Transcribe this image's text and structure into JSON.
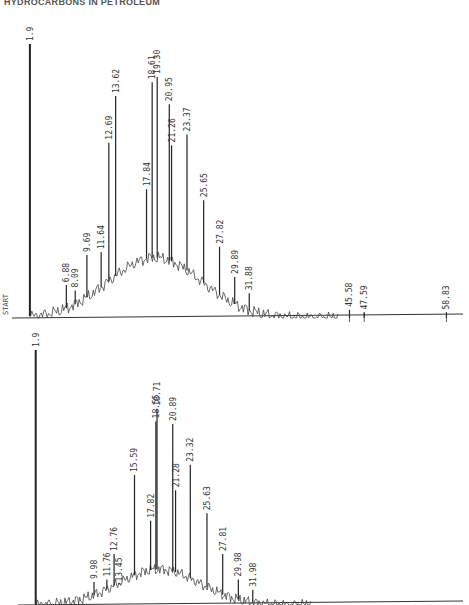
{
  "page": {
    "header": "HYDROCARBONS IN PETROLEUM"
  },
  "chart_data": [
    {
      "type": "line",
      "title": "Chromatogram A (top)",
      "xlabel": "Retention time (min)",
      "ylabel": "Detector response (relative)",
      "start_marker": "START",
      "solvent_peak_label": "1.9",
      "grid": false,
      "ylim": [
        0,
        100
      ],
      "peaks": [
        {
          "rt": 1.9,
          "height": 100
        },
        {
          "rt": 6.88,
          "height": 12
        },
        {
          "rt": 8.09,
          "height": 10
        },
        {
          "rt": 9.69,
          "height": 23
        },
        {
          "rt": 11.64,
          "height": 24
        },
        {
          "rt": 12.69,
          "height": 64
        },
        {
          "rt": 13.62,
          "height": 81
        },
        {
          "rt": 17.84,
          "height": 47
        },
        {
          "rt": 18.61,
          "height": 86
        },
        {
          "rt": 19.3,
          "height": 88
        },
        {
          "rt": 20.95,
          "height": 78
        },
        {
          "rt": 21.26,
          "height": 63
        },
        {
          "rt": 23.37,
          "height": 67
        },
        {
          "rt": 25.65,
          "height": 43
        },
        {
          "rt": 27.82,
          "height": 26
        },
        {
          "rt": 29.89,
          "height": 15
        },
        {
          "rt": 31.88,
          "height": 9
        },
        {
          "rt": 45.58,
          "height": 3
        },
        {
          "rt": 47.59,
          "height": 2
        },
        {
          "rt": 58.83,
          "height": 2
        }
      ]
    },
    {
      "type": "line",
      "title": "Chromatogram B (bottom)",
      "xlabel": "Retention time (min)",
      "ylabel": "Detector response (relative)",
      "grid": false,
      "ylim": [
        0,
        100
      ],
      "peaks": [
        {
          "rt": 1.9,
          "height": 100
        },
        {
          "rt": 9.98,
          "height": 9
        },
        {
          "rt": 11.76,
          "height": 10
        },
        {
          "rt": 12.76,
          "height": 20
        },
        {
          "rt": 13.45,
          "height": 8
        },
        {
          "rt": 15.59,
          "height": 51
        },
        {
          "rt": 17.82,
          "height": 33
        },
        {
          "rt": 18.55,
          "height": 72
        },
        {
          "rt": 18.71,
          "height": 77
        },
        {
          "rt": 20.89,
          "height": 71
        },
        {
          "rt": 21.28,
          "height": 45
        },
        {
          "rt": 23.32,
          "height": 55
        },
        {
          "rt": 25.63,
          "height": 36
        },
        {
          "rt": 27.81,
          "height": 20
        },
        {
          "rt": 29.98,
          "height": 10
        },
        {
          "rt": 31.98,
          "height": 6
        }
      ]
    }
  ]
}
